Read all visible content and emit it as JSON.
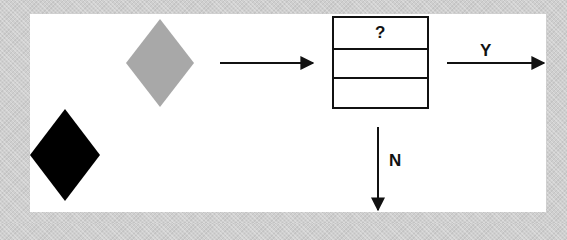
{
  "diagram": {
    "background_color": "#cfcfcf",
    "panel_color": "#ffffff",
    "shapes": [
      {
        "id": "grey-diamond",
        "type": "diamond",
        "fill": "#a8a8a8",
        "cx": 160,
        "cy": 63,
        "w": 68,
        "h": 88
      },
      {
        "id": "black-diamond",
        "type": "diamond",
        "fill": "#000000",
        "cx": 65,
        "cy": 155,
        "w": 70,
        "h": 92
      },
      {
        "id": "question-box",
        "type": "table-box",
        "x": 332,
        "y": 17,
        "w": 96,
        "h": 91,
        "rows": 3
      }
    ],
    "box_cells": [
      "?",
      "",
      ""
    ],
    "arrows": [
      {
        "id": "arrow-into-box",
        "from": [
          220,
          63
        ],
        "to": [
          314,
          63
        ]
      },
      {
        "id": "arrow-yes",
        "from": [
          447,
          63
        ],
        "to": [
          545,
          63
        ],
        "label": "Y"
      },
      {
        "id": "arrow-no",
        "from": [
          378,
          127
        ],
        "to": [
          378,
          211
        ],
        "label": "N"
      }
    ],
    "labels": {
      "yes": "Y",
      "no": "N",
      "question": "?"
    }
  }
}
